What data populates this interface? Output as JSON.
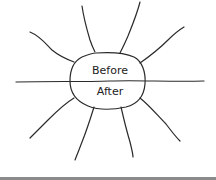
{
  "diagram": {
    "type": "before-after-sunburst",
    "center_labels": {
      "top": "Before",
      "bottom": "After"
    },
    "ray_count": 8,
    "stroke_color": "#2a2a2a",
    "background": "#ffffff",
    "footer_bar_color": "#8a8a8a"
  }
}
